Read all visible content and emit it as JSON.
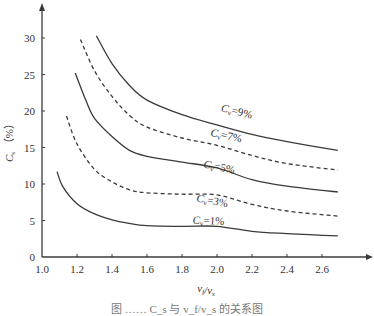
{
  "chart_data": {
    "type": "line",
    "title": "",
    "xlabel": "v_f/v_s",
    "ylabel": "C_s（%）",
    "xlim": [
      1.0,
      2.75
    ],
    "ylim": [
      0,
      32
    ],
    "x_ticks": [
      "1.0",
      "1.2",
      "1.4",
      "1.6",
      "1.8",
      "2.0",
      "2.2",
      "2.4",
      "2.6"
    ],
    "y_ticks": [
      "0",
      "5",
      "10",
      "15",
      "20",
      "25",
      "30"
    ],
    "grid": false,
    "legend": "inline curve labels",
    "series": [
      {
        "name": "Cv=9%",
        "style": "solid",
        "x": [
          1.31,
          1.4,
          1.5,
          1.6,
          1.8,
          2.0,
          2.2,
          2.4,
          2.69
        ],
        "y": [
          30.3,
          26.5,
          23.5,
          21.5,
          19.5,
          18.1,
          16.8,
          15.8,
          14.6
        ],
        "label_pos": [
          2.02,
          20.0
        ],
        "label_rot": 14
      },
      {
        "name": "Cv=7%",
        "style": "dashed",
        "x": [
          1.22,
          1.3,
          1.4,
          1.5,
          1.6,
          1.8,
          2.0,
          2.2,
          2.4,
          2.69
        ],
        "y": [
          29.8,
          25.5,
          22.0,
          19.4,
          17.8,
          16.3,
          15.3,
          13.9,
          12.8,
          11.9
        ],
        "label_pos": [
          1.96,
          16.6
        ],
        "label_rot": 12
      },
      {
        "name": "Cv=5%",
        "style": "solid",
        "x": [
          1.19,
          1.25,
          1.3,
          1.4,
          1.5,
          1.6,
          1.8,
          2.0,
          2.2,
          2.4,
          2.69
        ],
        "y": [
          25.2,
          21.5,
          19.0,
          16.5,
          14.6,
          13.8,
          13.0,
          12.2,
          10.6,
          9.7,
          8.9
        ],
        "label_pos": [
          1.92,
          12.3
        ],
        "label_rot": 12
      },
      {
        "name": "Cv=3%",
        "style": "dashed",
        "x": [
          1.14,
          1.2,
          1.3,
          1.4,
          1.5,
          1.6,
          1.8,
          2.0,
          2.2,
          2.4,
          2.69
        ],
        "y": [
          19.3,
          15.5,
          12.0,
          10.3,
          9.2,
          8.8,
          8.6,
          8.5,
          7.2,
          6.3,
          5.6
        ],
        "label_pos": [
          1.88,
          7.6
        ],
        "label_rot": 10
      },
      {
        "name": "Cv=1%",
        "style": "solid",
        "x": [
          1.086,
          1.12,
          1.2,
          1.3,
          1.4,
          1.5,
          1.6,
          1.8,
          2.0,
          2.2,
          2.4,
          2.69
        ],
        "y": [
          11.7,
          9.6,
          7.3,
          5.9,
          5.1,
          4.6,
          4.3,
          4.2,
          4.2,
          3.5,
          3.2,
          2.9
        ],
        "label_pos": [
          1.86,
          4.6
        ],
        "label_rot": 3
      }
    ]
  },
  "labels": {
    "x_axis_title": "v_f/v_s",
    "y_axis_title": "C_s（%）",
    "curve_labels": [
      "C_v=9%",
      "C_v=7%",
      "C_v=5%",
      "C_v=3%",
      "C_v=1%"
    ],
    "caption": "图 ……  C_s 与 v_f/v_s 的关系图"
  }
}
